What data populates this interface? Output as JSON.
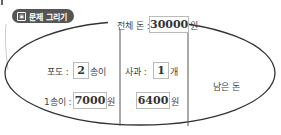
{
  "header": {
    "label": "문제 그리기",
    "icon": "picture-icon"
  },
  "total": {
    "label": "전체 돈 :",
    "value": "30000",
    "unit": "원"
  },
  "grape": {
    "count_label": "포도 :",
    "count_value": "2",
    "count_unit": "송이",
    "price_label": "1송이 :",
    "price_value": "7000",
    "price_unit": "원"
  },
  "apple": {
    "count_label": "사과 :",
    "count_value": "1",
    "count_unit": "개",
    "price_value": "6400",
    "price_unit": "원"
  },
  "remaining": {
    "label": "남은 돈"
  },
  "colors": {
    "pill": "#555555",
    "line": "#333333",
    "box_border": "#bbbbbb"
  }
}
